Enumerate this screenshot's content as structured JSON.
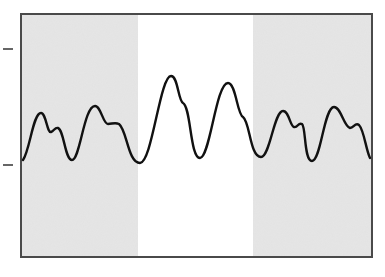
{
  "figure": {
    "frame": {
      "x": 21,
      "y": 14,
      "width": 351,
      "height": 243,
      "stroke": "#4a4a4a"
    },
    "regions": [
      {
        "name": "left-shaded-region",
        "x": 21,
        "width": 117,
        "fill": "#e6e6e6"
      },
      {
        "name": "center-unshaded-region",
        "x": 138,
        "width": 115,
        "fill": "#ffffff"
      },
      {
        "name": "right-shaded-region",
        "x": 253,
        "width": 119,
        "fill": "#e6e6e6"
      }
    ],
    "ticks": [
      {
        "name": "upper-left-tick",
        "x1": 3,
        "x2": 13,
        "y": 49
      },
      {
        "name": "lower-left-tick",
        "x1": 3,
        "x2": 13,
        "y": 165
      }
    ],
    "trace": {
      "stroke": "#111111",
      "stroke_width": 2.4,
      "path": "M23,160 C30,150 33,113 41,113 C46,113 47,133 51,132 C54,131 55,127 58,128 C64,130 65,160 72,160 C80,160 84,106 95,106 C101,106 103,124 108,124 C112,124 115,122 119,124 C127,130 128,163 140,163 C152,163 160,76 171,76 C178,76 178,100 183,103 C191,107 190,158 200,158 C210,158 216,83 228,83 C236,83 237,114 243,117 C250,122 250,157 261,157 C270,157 274,111 283,111 C289,111 290,126 294,127 C298,128 298,122 302,124 C306,127 304,161 312,161 C321,161 324,107 334,107 C341,107 344,127 350,128 C354,128 355,122 359,125 C364,130 366,150 370,158"
    }
  }
}
